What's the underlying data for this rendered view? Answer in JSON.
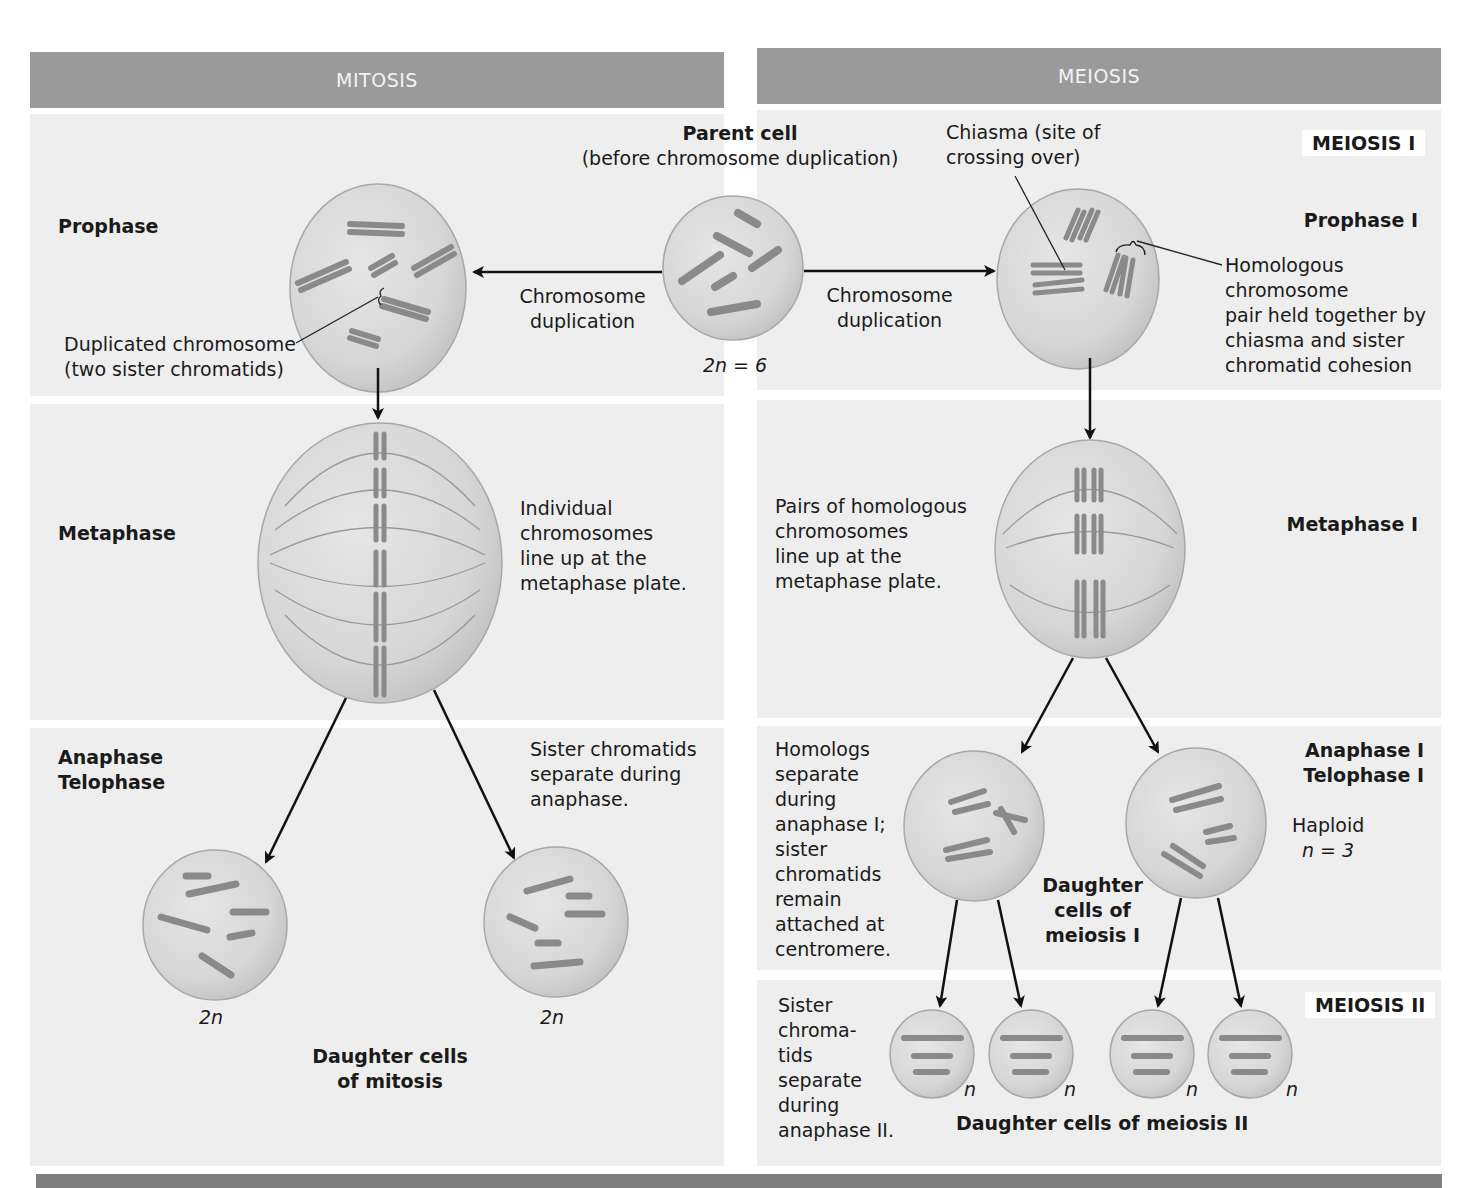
{
  "headers": {
    "mitosis": "MITOSIS",
    "meiosis": "MEIOSIS"
  },
  "parent_cell": {
    "title": "Parent cell",
    "subtitle": "(before chromosome duplication)",
    "ploidy": "2n = 6"
  },
  "arrows": {
    "left_duplication": [
      "Chromosome",
      "duplication"
    ],
    "right_duplication": [
      "Chromosome",
      "duplication"
    ]
  },
  "mitosis": {
    "prophase": {
      "label": "Prophase",
      "callout": [
        "Duplicated chromosome",
        "(two sister chromatids)"
      ]
    },
    "metaphase": {
      "label": "Metaphase",
      "note": [
        "Individual",
        "chromosomes",
        "line up at the",
        "metaphase plate."
      ]
    },
    "anaphase_telophase": {
      "label": [
        "Anaphase",
        "Telophase"
      ],
      "note": [
        "Sister chromatids",
        "separate during",
        "anaphase."
      ]
    },
    "daughter_cells": {
      "ploidy_left": "2n",
      "ploidy_right": "2n",
      "caption": [
        "Daughter cells",
        "of mitosis"
      ]
    }
  },
  "meiosis": {
    "meiosis_one_tag": "MEIOSIS I",
    "prophase_one": {
      "label": "Prophase I",
      "chiasma_callout": [
        "Chiasma (site of",
        "crossing over)"
      ],
      "homolog_callout": [
        "Homologous",
        "chromosome",
        "pair held together by",
        "chiasma and sister",
        "chromatid cohesion"
      ]
    },
    "metaphase_one": {
      "label": "Metaphase I",
      "note": [
        "Pairs of homologous",
        "chromosomes",
        "line up at the",
        "metaphase plate."
      ]
    },
    "anaphase_telophase_one": {
      "label": [
        "Anaphase I",
        "Telophase I"
      ],
      "note": [
        "Homologs",
        "separate",
        "during",
        "anaphase I;",
        "sister",
        "chromatids",
        "remain",
        "attached at",
        "centromere."
      ],
      "haploid": [
        "Haploid",
        "n = 3"
      ],
      "caption": [
        "Daughter",
        "cells of",
        "meiosis I"
      ]
    },
    "meiosis_two_tag": "MEIOSIS II",
    "meiosis_two": {
      "note": [
        "Sister",
        "chroma-",
        "tids",
        "separate",
        "during",
        "anaphase II."
      ],
      "ploidy": [
        "n",
        "n",
        "n",
        "n"
      ],
      "caption": "Daughter cells of meiosis II"
    }
  },
  "colors": {
    "header": "#9a9a9a",
    "band": "#eeeeee",
    "cell_fill": "#d9d9d9",
    "cell_stroke": "#a8a8a8",
    "chromosome": "#8a8a8a",
    "footer": "#7f7f7f"
  }
}
